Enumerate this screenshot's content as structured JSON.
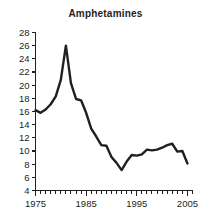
{
  "chart_data": {
    "type": "line",
    "title": "Amphetamines",
    "xlabel": "",
    "ylabel": "",
    "xlim": [
      1975,
      2006
    ],
    "ylim": [
      4,
      28
    ],
    "grid": false,
    "legend": null,
    "y_ticks": [
      4,
      6,
      8,
      10,
      12,
      14,
      16,
      18,
      20,
      22,
      24,
      26,
      28
    ],
    "y_tick_labels": [
      "4",
      "6",
      "8",
      "10",
      "12",
      "14",
      "16",
      "18",
      "20",
      "22",
      "24",
      "26",
      "28"
    ],
    "x_ticks": [
      1975,
      1985,
      1995,
      2005
    ],
    "x_tick_labels": [
      "1975",
      "1985",
      "1995",
      "2005"
    ],
    "x_minor_tick_step": 1,
    "line_color": "#231f20",
    "series": [
      {
        "name": "Amphetamines",
        "x": [
          1975,
          1976,
          1977,
          1978,
          1979,
          1980,
          1981,
          1982,
          1983,
          1984,
          1985,
          1986,
          1987,
          1988,
          1989,
          1990,
          1991,
          1992,
          1993,
          1994,
          1995,
          1996,
          1997,
          1998,
          1999,
          2000,
          2001,
          2002,
          2003,
          2004,
          2005
        ],
        "values": [
          16.2,
          15.8,
          16.3,
          17.1,
          18.3,
          20.8,
          26.0,
          20.3,
          17.9,
          17.7,
          15.8,
          13.4,
          12.2,
          10.9,
          10.8,
          9.1,
          8.2,
          7.1,
          8.4,
          9.4,
          9.3,
          9.5,
          10.2,
          10.1,
          10.2,
          10.5,
          10.9,
          11.1,
          9.9,
          10.0,
          8.1
        ],
        "units": "percent"
      }
    ]
  }
}
